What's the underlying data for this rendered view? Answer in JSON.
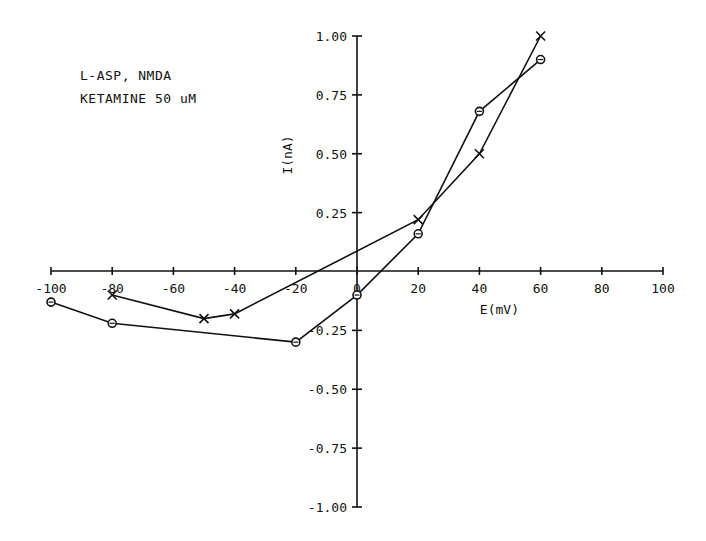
{
  "annotation": {
    "line1": "L-ASP, NMDA",
    "line2": "KETAMINE 50 uM"
  },
  "chart_data": {
    "type": "line",
    "title": "",
    "xlabel": "E(mV)",
    "ylabel": "I(nA)",
    "xlim": [
      -100,
      100
    ],
    "ylim": [
      -1.0,
      1.0
    ],
    "x_ticks": [
      "-100",
      "-80",
      "-60",
      "-40",
      "-20",
      "0",
      "20",
      "40",
      "60",
      "80",
      "100"
    ],
    "y_ticks": [
      "1.00",
      "0.75",
      "0.50",
      "0.25",
      "-0.25",
      "-0.50",
      "-0.75",
      "-1.00"
    ],
    "grid": false,
    "legend": null,
    "annotations": [
      "L-ASP, NMDA",
      "KETAMINE 50 uM"
    ],
    "series": [
      {
        "name": "circles",
        "marker": "o",
        "points": [
          [
            -100,
            -0.13
          ],
          [
            -80,
            -0.22
          ],
          [
            -20,
            -0.3
          ],
          [
            0,
            -0.1
          ],
          [
            20,
            0.16
          ],
          [
            40,
            0.68
          ],
          [
            60,
            0.9
          ]
        ]
      },
      {
        "name": "crosses",
        "marker": "x",
        "points": [
          [
            -80,
            -0.1
          ],
          [
            -50,
            -0.2
          ],
          [
            -40,
            -0.18
          ],
          [
            20,
            0.22
          ],
          [
            40,
            0.5
          ],
          [
            60,
            1.0
          ]
        ]
      }
    ]
  }
}
